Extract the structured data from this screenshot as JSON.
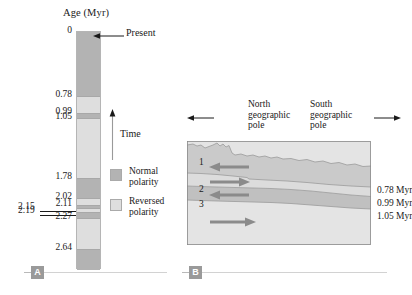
{
  "figure": {
    "panelA": {
      "badge": "A",
      "axis_title": "Age (Myr)",
      "present_label": "Present",
      "time_label": "Time",
      "age_labels": [
        "0",
        "0.78",
        "0.99",
        "1.05",
        "1.78",
        "2.02",
        "2.11",
        "2.27",
        "2.64"
      ],
      "outdent_labels": [
        "2.15",
        "2.19"
      ],
      "legend": [
        {
          "label_line1": "Normal",
          "label_line2": "polarity",
          "swatch": "normal",
          "color": "#b3b3b3"
        },
        {
          "label_line1": "Reversed",
          "label_line2": "polarity",
          "swatch": "reversed",
          "color": "#dedede"
        }
      ]
    },
    "panelB": {
      "badge": "B",
      "north_pole_line1": "North",
      "north_pole_line2": "geographic",
      "north_pole_line3": "pole",
      "south_pole_line1": "South",
      "south_pole_line2": "geographic",
      "south_pole_line3": "pole",
      "layer_numbers": [
        "1",
        "2",
        "3"
      ],
      "boundary_ages": [
        "0.78 Myr",
        "0.99 Myr",
        "1.05 Myr"
      ]
    }
  },
  "chart_data": {
    "type": "table",
    "panel_a": {
      "name": "Geomagnetic polarity timescale",
      "xlabel": "",
      "ylabel": "Age (Myr)",
      "ylim": [
        0,
        2.9
      ],
      "axis_direction": "time increases downward; Time arrow points upward toward Present",
      "tick_values": [
        0,
        0.78,
        0.99,
        1.05,
        1.78,
        2.02,
        2.11,
        2.15,
        2.19,
        2.27,
        2.64
      ],
      "tick_labels": [
        "0",
        "0.78",
        "0.99",
        "1.05",
        "1.78",
        "2.02",
        "2.11",
        "2.15",
        "2.19",
        "2.27",
        "2.64"
      ],
      "intervals": [
        {
          "from": 0.0,
          "to": 0.78,
          "polarity": "normal",
          "color": "#b3b3b3"
        },
        {
          "from": 0.78,
          "to": 0.99,
          "polarity": "reversed",
          "color": "#dedede"
        },
        {
          "from": 0.99,
          "to": 1.05,
          "polarity": "normal",
          "color": "#b3b3b3"
        },
        {
          "from": 1.05,
          "to": 1.78,
          "polarity": "reversed",
          "color": "#dedede"
        },
        {
          "from": 1.78,
          "to": 2.02,
          "polarity": "normal",
          "color": "#b3b3b3"
        },
        {
          "from": 2.02,
          "to": 2.11,
          "polarity": "reversed",
          "color": "#dedede"
        },
        {
          "from": 2.11,
          "to": 2.15,
          "polarity": "normal",
          "color": "#b3b3b3"
        },
        {
          "from": 2.15,
          "to": 2.19,
          "polarity": "reversed",
          "color": "#dedede"
        },
        {
          "from": 2.19,
          "to": 2.27,
          "polarity": "normal",
          "color": "#b3b3b3"
        },
        {
          "from": 2.27,
          "to": 2.64,
          "polarity": "reversed",
          "color": "#dedede"
        },
        {
          "from": 2.64,
          "to": 2.9,
          "polarity": "normal",
          "color": "#b3b3b3"
        }
      ],
      "legend": [
        "Normal polarity",
        "Reversed polarity"
      ],
      "legend_position": "right"
    },
    "panel_b": {
      "name": "Magnetized sediment layers cross-section",
      "orientation_left": "North geographic pole",
      "orientation_right": "South geographic pole",
      "layers": [
        {
          "number": "1",
          "top_age": 0.0,
          "base_age": 0.78,
          "polarity": "normal",
          "arrow_direction": "left",
          "color": "#c9c9c9"
        },
        {
          "number": "2",
          "top_age": 0.78,
          "base_age": 0.99,
          "polarity": "reversed",
          "arrow_direction": "right",
          "color": "#dcdcdc"
        },
        {
          "number": "3",
          "top_age": 0.99,
          "base_age": 1.05,
          "polarity": "normal",
          "arrow_direction": "left",
          "color": "#c2c2c2"
        },
        {
          "number": "",
          "top_age": 1.05,
          "base_age": null,
          "polarity": "reversed",
          "arrow_direction": "right",
          "color": "#e2e2e2"
        }
      ],
      "boundary_labels": [
        "0.78 Myr",
        "0.99 Myr",
        "1.05 Myr"
      ]
    }
  }
}
